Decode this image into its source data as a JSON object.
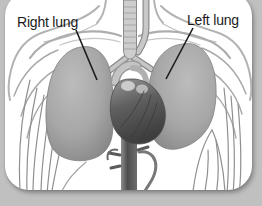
{
  "labels": {
    "right_lung": "Right lung",
    "left_lung": "Left lung"
  },
  "colors": {
    "background": "#c0c0c0",
    "card": "#ffffff",
    "label_text": "#1b1b1b",
    "leader_line": "#1b1b1b",
    "lung_base": "#a0a0a0",
    "heart_base": "#5f5f5f",
    "outline_gray": "#9a9a9a",
    "rib_gray": "#8f8f8f",
    "trachea": "#cdcdcd"
  }
}
